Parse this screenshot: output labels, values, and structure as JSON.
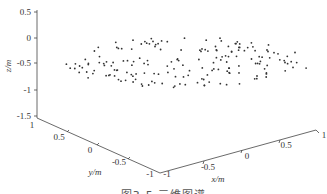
{
  "chart_data": {
    "type": "scatter3d",
    "title": "",
    "caption": "图3-5 三维图谱",
    "xlabel": "x/m",
    "ylabel": "y/m",
    "zlabel": "z/m",
    "xlim": [
      -1,
      1
    ],
    "ylim": [
      -1,
      1
    ],
    "zlim": [
      -1.5,
      0.5
    ],
    "x_ticks": [
      "-1",
      "-0.5",
      "0",
      "0.5",
      "1"
    ],
    "y_ticks": [
      "1",
      "0.5",
      "0",
      "-0.5",
      "-1"
    ],
    "z_ticks": [
      "0.5",
      "0",
      "-0.5",
      "-1",
      "-1.5"
    ],
    "grid": false,
    "point_count_estimate": 180,
    "point_color": "#333333"
  }
}
